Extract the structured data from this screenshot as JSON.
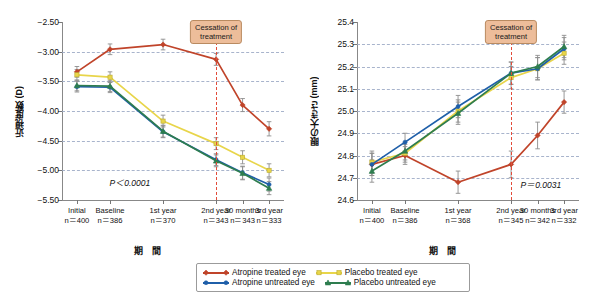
{
  "figure": {
    "xaxis_title": "期　間",
    "cessation_label_line1": "Cessation of",
    "cessation_label_line2": "treatment",
    "colors": {
      "atropine_treated": "#c0442a",
      "atropine_untreated": "#1f5fa9",
      "placebo_treated": "#e8d54a",
      "placebo_untreated": "#2e7d4f",
      "cessation_line": "#e24b3a",
      "cessation_box_bg": "#edbd9a",
      "gridline": "#9aa7c4"
    }
  },
  "legend": {
    "items": [
      {
        "label": "Atropine treated eye",
        "color": "#c0442a",
        "marker": "diamond"
      },
      {
        "label": "Placebo treated eye",
        "color": "#e8d54a",
        "marker": "square"
      },
      {
        "label": "Atropine untreated eye",
        "color": "#1f5fa9",
        "marker": "circle"
      },
      {
        "label": "Placebo untreated eye",
        "color": "#2e7d4f",
        "marker": "triangle"
      }
    ]
  },
  "chart_data": [
    {
      "type": "line",
      "id": "left",
      "title": "",
      "ylabel": "近視度数 (D)",
      "xlabel": "期　間",
      "ylim": [
        -5.5,
        -2.5
      ],
      "yticks": [
        -2.5,
        -3.0,
        -3.5,
        -4.0,
        -4.5,
        -5.0,
        -5.5
      ],
      "ytick_labels": [
        "−2.50",
        "−3.00",
        "−3.50",
        "−4.00",
        "−4.50",
        "−5.00",
        "−5.50"
      ],
      "grid": true,
      "categories": [
        "Initial",
        "Baseline",
        "1st year",
        "2nd year",
        "30 months",
        "3rd year"
      ],
      "category_n": [
        "n＝400",
        "n＝386",
        "n＝370",
        "n＝343",
        "n＝343",
        "n＝333"
      ],
      "x_positions": [
        0,
        1,
        2.6,
        4.2,
        5.0,
        5.8
      ],
      "annotation": {
        "text": "P＜0.0001",
        "x": 1.6,
        "y": -5.2
      },
      "cessation_x": 4.2,
      "series": [
        {
          "name": "Atropine treated eye",
          "color": "#c0442a",
          "marker": "diamond",
          "values": [
            -3.34,
            -2.96,
            -2.88,
            -3.13,
            -3.9,
            -4.3
          ],
          "errors": [
            0.09,
            0.09,
            0.09,
            0.1,
            0.11,
            0.12
          ]
        },
        {
          "name": "Placebo treated eye",
          "color": "#e8d54a",
          "marker": "square",
          "values": [
            -3.39,
            -3.43,
            -4.17,
            -4.55,
            -4.78,
            -5.0
          ],
          "errors": [
            0.09,
            0.09,
            0.1,
            0.1,
            0.11,
            0.11
          ]
        },
        {
          "name": "Atropine untreated eye",
          "color": "#1f5fa9",
          "marker": "circle",
          "values": [
            -3.59,
            -3.6,
            -4.35,
            -4.82,
            -5.04,
            -5.24
          ],
          "errors": [
            0.09,
            0.09,
            0.1,
            0.1,
            0.11,
            0.11
          ]
        },
        {
          "name": "Placebo untreated eye",
          "color": "#2e7d4f",
          "marker": "triangle",
          "values": [
            -3.57,
            -3.58,
            -4.34,
            -4.84,
            -5.05,
            -5.3
          ],
          "errors": [
            0.09,
            0.09,
            0.1,
            0.1,
            0.11,
            0.11
          ]
        }
      ]
    },
    {
      "type": "line",
      "id": "right",
      "title": "",
      "ylabel": "眼の大きさ (mm)",
      "xlabel": "期　間",
      "ylim": [
        24.6,
        25.4
      ],
      "yticks": [
        25.4,
        25.3,
        25.2,
        25.1,
        25.0,
        24.9,
        24.8,
        24.7,
        24.6
      ],
      "ytick_labels": [
        "25.4",
        "25.3",
        "25.2",
        "25.1",
        "25.0",
        "24.9",
        "24.8",
        "24.7",
        "24.6"
      ],
      "grid": true,
      "categories": [
        "Initial",
        "Baseline",
        "1st year",
        "2nd year",
        "30 months",
        "3rd year"
      ],
      "category_n": [
        "n＝400",
        "n＝386",
        "n＝368",
        "n＝345",
        "n＝342",
        "n＝332"
      ],
      "x_positions": [
        0,
        1,
        2.6,
        4.2,
        5.0,
        5.8
      ],
      "annotation": {
        "text": "P＝0.0031",
        "x": 5.1,
        "y": 24.67
      },
      "cessation_x": 4.2,
      "series": [
        {
          "name": "Atropine treated eye",
          "color": "#c0442a",
          "marker": "diamond",
          "values": [
            24.76,
            24.8,
            24.68,
            24.76,
            24.89,
            25.04
          ],
          "errors": [
            0.05,
            0.04,
            0.05,
            0.06,
            0.06,
            0.05
          ]
        },
        {
          "name": "Placebo treated eye",
          "color": "#e8d54a",
          "marker": "square",
          "values": [
            24.77,
            24.81,
            25.0,
            25.15,
            25.19,
            25.26
          ],
          "errors": [
            0.05,
            0.04,
            0.05,
            0.05,
            0.05,
            0.05
          ]
        },
        {
          "name": "Atropine untreated eye",
          "color": "#1f5fa9",
          "marker": "circle",
          "values": [
            24.76,
            24.86,
            25.02,
            25.17,
            25.19,
            25.28
          ],
          "errors": [
            0.05,
            0.04,
            0.05,
            0.05,
            0.05,
            0.05
          ]
        },
        {
          "name": "Placebo untreated eye",
          "color": "#2e7d4f",
          "marker": "triangle",
          "values": [
            24.73,
            24.82,
            24.99,
            25.17,
            25.2,
            25.29
          ],
          "errors": [
            0.05,
            0.04,
            0.05,
            0.05,
            0.05,
            0.05
          ]
        }
      ]
    }
  ]
}
